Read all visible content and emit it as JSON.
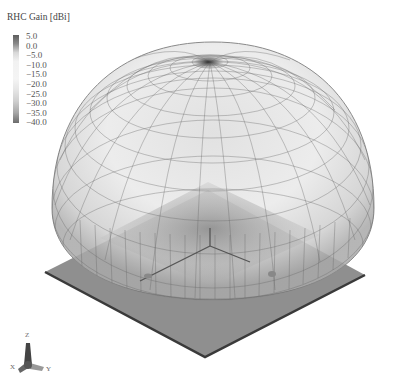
{
  "figure": {
    "type": "3d-radiation-pattern",
    "legend": {
      "title": "RHC Gain [dBi]",
      "ticks": [
        "5.0",
        "0.0",
        "−5.0",
        "−10.0",
        "−15.0",
        "−20.0",
        "−25.0",
        "−30.0",
        "−35.0",
        "−40.0"
      ],
      "max": 5.0,
      "min": -40.0,
      "colors": [
        "#5e5e5e",
        "#f4f4f4",
        "#6c6c6c"
      ]
    },
    "axis_triad": {
      "labels": [
        "Z",
        "X",
        "Y"
      ]
    },
    "colors": {
      "mesh_line": "#6a6a6a",
      "dome_fill": "#d9d9d9",
      "ground_plane": "#8f8f8f",
      "ground_edge": "#3a3a3a",
      "background": "#ffffff"
    }
  }
}
